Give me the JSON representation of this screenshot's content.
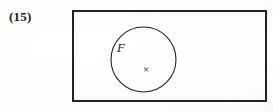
{
  "figure": {
    "number_label": "(15)",
    "caption": ""
  },
  "canvas": {
    "width": 273,
    "height": 112,
    "background_color": "#fdfdfc",
    "ink_color": "#1a1a1a"
  },
  "diagram": {
    "type": "venn-set-diagram",
    "universe_rectangle": {
      "name": "universal-set-rectangle",
      "x": 73,
      "y": 11,
      "width": 193,
      "height": 90,
      "stroke_width": 1.6,
      "stroke_color": "#232323",
      "fill": "none",
      "label": ""
    },
    "subset_circle": {
      "name": "subset-circle-F",
      "cx": 143.5,
      "cy": 59.5,
      "r": 32.5,
      "stroke_width": 1.1,
      "stroke_color": "#232323",
      "fill": "none",
      "label": "F",
      "label_x": 121,
      "label_y": 52
    },
    "point": {
      "name": "element-point",
      "glyph": "×",
      "x": 146,
      "y": 73,
      "label": ""
    }
  }
}
